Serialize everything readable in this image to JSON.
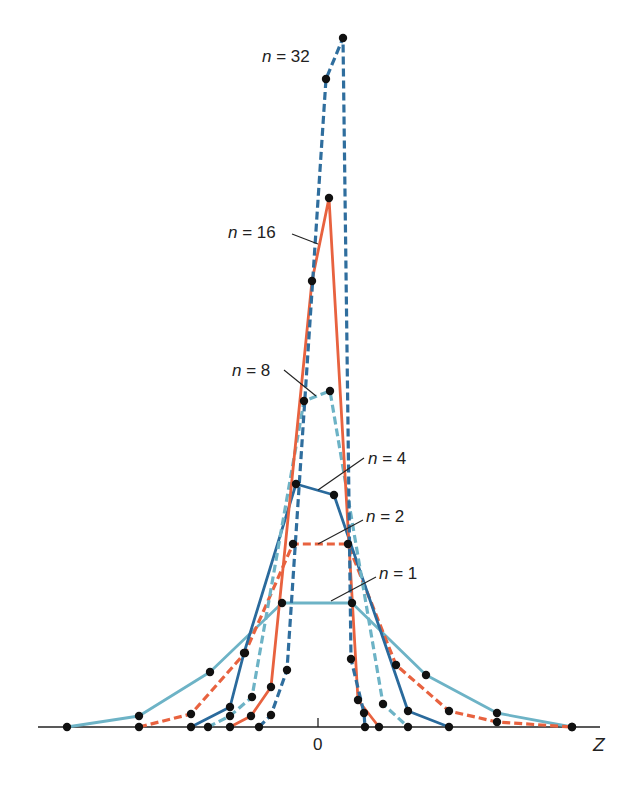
{
  "chart_data": {
    "type": "line",
    "title": "",
    "xlabel": "Z",
    "ylabel": "",
    "x_ticks": [
      "0"
    ],
    "grid": false,
    "legend": "inline labels",
    "px_axis": {
      "x0": 318,
      "baseline": 727,
      "x_end": 600
    },
    "series": [
      {
        "name": "n = 1",
        "color": "#6db3c6",
        "style": "solid",
        "points": [
          [
            67,
            727
          ],
          [
            139,
            716
          ],
          [
            210,
            672
          ],
          [
            282,
            603
          ],
          [
            352,
            603
          ],
          [
            426,
            675
          ],
          [
            497,
            713
          ],
          [
            572,
            727
          ]
        ],
        "label": {
          "text_n": "n",
          "text_rest": " = 1",
          "x": 379,
          "y": 565,
          "line": [
            [
              376,
              577
            ],
            [
              331,
              601
            ]
          ]
        }
      },
      {
        "name": "n = 2",
        "color": "#e8623f",
        "style": "dashed",
        "points": [
          [
            139,
            727
          ],
          [
            191,
            714
          ],
          [
            245,
            653
          ],
          [
            293,
            544
          ],
          [
            348,
            544
          ],
          [
            396,
            665
          ],
          [
            449,
            711
          ],
          [
            497,
            722
          ],
          [
            572,
            727
          ]
        ],
        "label": {
          "text_n": "n",
          "text_rest": " = 2",
          "x": 366,
          "y": 508,
          "line": [
            [
              363,
              520
            ],
            [
              318,
              544
            ]
          ]
        }
      },
      {
        "name": "n = 4",
        "color": "#2a6a9c",
        "style": "solid",
        "points": [
          [
            191,
            727
          ],
          [
            230,
            707
          ],
          [
            244,
            653
          ],
          [
            296,
            484
          ],
          [
            334,
            495
          ],
          [
            408,
            711
          ],
          [
            449,
            727
          ]
        ],
        "label": {
          "text_n": "n",
          "text_rest": " = 4",
          "x": 368,
          "y": 450,
          "line": [
            [
              364,
              458
            ],
            [
              318,
              490
            ]
          ]
        }
      },
      {
        "name": "n = 8",
        "color": "#6db3c6",
        "style": "dashed",
        "points": [
          [
            208,
            727
          ],
          [
            230,
            716
          ],
          [
            252,
            697
          ],
          [
            304,
            401
          ],
          [
            330,
            391
          ],
          [
            383,
            704
          ],
          [
            408,
            727
          ]
        ],
        "label": {
          "text_n": "n",
          "text_rest": " = 8",
          "x": 232,
          "y": 362,
          "line": [
            [
              284,
              370
            ],
            [
              316,
              396
            ]
          ]
        }
      },
      {
        "name": "n = 16",
        "color": "#e8623f",
        "style": "solid",
        "points": [
          [
            230,
            727
          ],
          [
            251,
            716
          ],
          [
            271,
            687
          ],
          [
            312,
            281
          ],
          [
            329,
            198
          ],
          [
            358,
            700
          ],
          [
            379,
            727
          ]
        ],
        "label": {
          "text_n": "n",
          "text_rest": " = 16",
          "x": 228,
          "y": 224,
          "line": [
            [
              292,
              234
            ],
            [
              318,
              244
            ]
          ]
        }
      },
      {
        "name": "n = 32",
        "color": "#2f6e9e",
        "style": "dashed",
        "points": [
          [
            259,
            727
          ],
          [
            271,
            715
          ],
          [
            287,
            670
          ],
          [
            326,
            79
          ],
          [
            343,
            38
          ],
          [
            351,
            659
          ],
          [
            364,
            713
          ],
          [
            365,
            727
          ]
        ],
        "label": {
          "text_n": "n",
          "text_rest": " = 32",
          "x": 262,
          "y": 48,
          "line": null
        }
      }
    ]
  }
}
